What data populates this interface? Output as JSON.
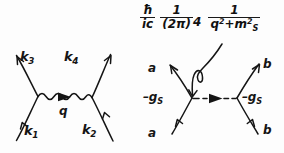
{
  "figure": {
    "ink_color": "#151515",
    "background_color": "#fdfdfd"
  },
  "left_diagram": {
    "name": "generic-tree-level-exchange-diagram",
    "propagator_style": "wavy",
    "labels": {
      "incoming_left": "k",
      "incoming_left_sub": "1",
      "incoming_right": "k",
      "incoming_right_sub": "2",
      "outgoing_left": "k",
      "outgoing_left_sub": "3",
      "outgoing_right": "k",
      "outgoing_right_sub": "4",
      "propagator_momentum": "q"
    }
  },
  "formula": {
    "factor1": {
      "numerator": "ħ",
      "denominator": "ic"
    },
    "factor2": {
      "numerator": "1",
      "denominator": "(2π)",
      "denominator_exponent": "4"
    },
    "factor3": {
      "numerator": "1",
      "denominator_first": "q",
      "denominator_first_exponent": "2",
      "denominator_operator": "+",
      "denominator_second": "m",
      "denominator_second_subscript": "S",
      "denominator_second_exponent": "2"
    }
  },
  "right_diagram": {
    "name": "scalar-exchange-diagram",
    "propagator_style": "dashed",
    "labels": {
      "upper_left_leg": "a",
      "lower_left_leg": "a",
      "upper_right_leg": "b",
      "lower_right_leg": "b",
      "left_vertex_coupling": "–g",
      "left_vertex_coupling_sub": "S",
      "right_vertex_coupling": "–g",
      "right_vertex_coupling_sub": "S"
    }
  },
  "annotation": {
    "pointer": "curved-arrow-from-propagator-factor-to-internal-line"
  }
}
